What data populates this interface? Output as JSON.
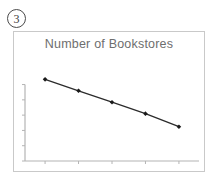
{
  "figure": {
    "badge_label": "3"
  },
  "chart_data": {
    "type": "line",
    "title": "Number of Bookstores",
    "xlabel": "",
    "ylabel": "",
    "categories": [
      "1",
      "2",
      "3",
      "4",
      "5"
    ],
    "x": [
      1,
      2,
      3,
      4,
      5
    ],
    "values": [
      5,
      4.3,
      3.6,
      2.9,
      2.1
    ],
    "series": [
      {
        "name": "Number of Bookstores",
        "values": [
          5,
          4.3,
          3.6,
          2.9,
          2.1
        ]
      }
    ],
    "xlim": [
      0.4,
      5.6
    ],
    "ylim": [
      0,
      6
    ],
    "x_tick_count": 5,
    "y_tick_count": 6,
    "x_tick_labels": [
      "",
      "",
      "",
      "",
      ""
    ],
    "y_tick_labels": [
      "",
      "",
      "",
      "",
      "",
      ""
    ],
    "grid": false,
    "legend": false,
    "legend_position": "none",
    "marker": "diamond",
    "line_color": "#2b2b2b",
    "marker_color": "#1a1a1a",
    "axis_color": "#b4b4b4",
    "title_color": "#6e6e6e",
    "frame_color": "#c9c9c9",
    "background": "#ffffff"
  }
}
